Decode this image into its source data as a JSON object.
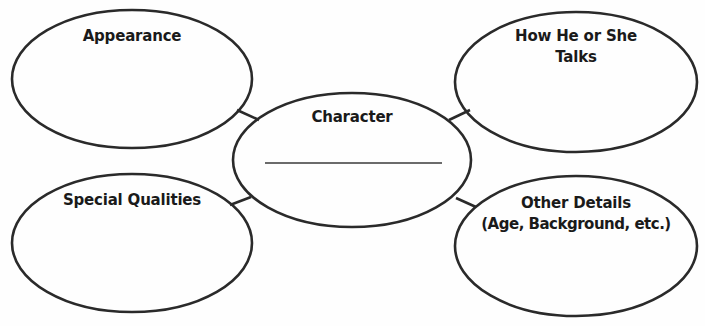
{
  "colors": {
    "stroke": "#2a2a2a",
    "text": "#1a1a1a",
    "background": "#fefefe"
  },
  "center": {
    "label": "Character",
    "blank_line": true
  },
  "nodes": [
    {
      "id": "appearance",
      "line1": "Appearance",
      "line2": ""
    },
    {
      "id": "talks",
      "line1": "How He or She",
      "line2": "Talks"
    },
    {
      "id": "special-qualities",
      "line1": "Special Qualities",
      "line2": ""
    },
    {
      "id": "other-details",
      "line1": "Other Details",
      "line2": "(Age, Background, etc.)"
    }
  ]
}
